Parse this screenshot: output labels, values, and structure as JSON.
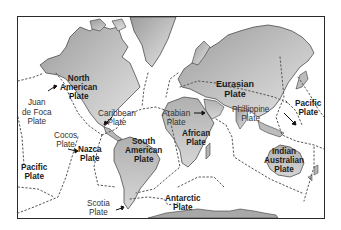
{
  "map": {
    "title": "Tectonic Plates of the World",
    "colors": {
      "land_dark": "#9c9c9c",
      "land_light": "#dcdcdc",
      "coast": "#3a3a3a",
      "boundary": "#555555",
      "frame": "#2a2a2a"
    },
    "plates": [
      {
        "id": "north-american",
        "line1": "North",
        "line2": "American",
        "line3": "Plate",
        "bold": true
      },
      {
        "id": "eurasian",
        "line1": "Eurasian",
        "line2": "Plate",
        "bold": true
      },
      {
        "id": "juan-de-foca",
        "line1": "Juan",
        "line2": "de Foca",
        "line3": "Plate",
        "bold": false
      },
      {
        "id": "caribbean",
        "line1": "Caribbean",
        "line2": "Plate",
        "bold": false
      },
      {
        "id": "cocos",
        "line1": "Cocos",
        "line2": "Plate",
        "bold": false
      },
      {
        "id": "arabian",
        "line1": "Arabian",
        "line2": "Plate",
        "bold": false
      },
      {
        "id": "phillippine",
        "line1": "Phillippine",
        "line2": "Plate",
        "bold": false
      },
      {
        "id": "pacific-east",
        "line1": "Pacific",
        "line2": "Plate",
        "bold": true
      },
      {
        "id": "african",
        "line1": "African",
        "line2": "Plate",
        "bold": true
      },
      {
        "id": "south-american",
        "line1": "South",
        "line2": "American",
        "line3": "Plate",
        "bold": true
      },
      {
        "id": "nazca",
        "line1": "Nazca",
        "line2": "Plate",
        "bold": true
      },
      {
        "id": "pacific-west",
        "line1": "Pacific",
        "line2": "Plate",
        "bold": true
      },
      {
        "id": "indian-australian",
        "line1": "Indian",
        "line2": "Australian",
        "line3": "Plate",
        "bold": true
      },
      {
        "id": "scotia",
        "line1": "Scotia",
        "line2": "Plate",
        "bold": false
      },
      {
        "id": "antarctic",
        "line1": "Antarctic",
        "line2": "Plate",
        "bold": true
      }
    ]
  }
}
